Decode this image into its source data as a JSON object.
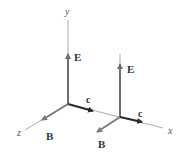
{
  "figure": {
    "axes": {
      "y_label": "y",
      "z_label": "z",
      "x_label": "x"
    },
    "point1": {
      "E_label": "E",
      "B_label": "B",
      "c_label": "c"
    },
    "point2": {
      "E_label": "E",
      "B_label": "B",
      "c_label": "c"
    },
    "colors": {
      "axis": "#8a8a8a",
      "E_vector": "#6e6e6e",
      "B_vector": "#7a7a7a",
      "c_vector": "#2a2a2a",
      "label": "#333333"
    }
  }
}
